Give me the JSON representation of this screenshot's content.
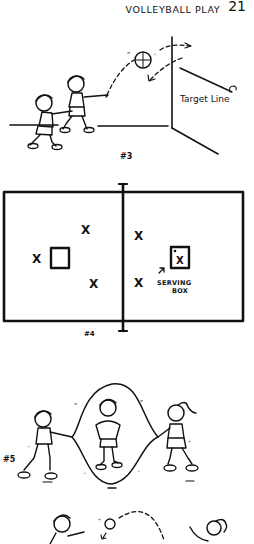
{
  "header": {
    "title": "VOLLEYBALL PLAY",
    "page_number": "21"
  },
  "figures": [
    {
      "number": "#3",
      "description": "Two children, one tossing a ball against a wall above a target line",
      "labels": {
        "target_line": "Target Line"
      }
    },
    {
      "number": "#4",
      "description": "Court diagram divided by a net, with player positions marked X and a serving box",
      "labels": {
        "serving_box": "SERVING BOX",
        "serving_box_line1": "SERVING",
        "serving_box_line2": "BOX"
      },
      "markers": {
        "left_court": [
          "X",
          "X",
          "X"
        ],
        "right_court": [
          "X",
          "X",
          "X"
        ]
      }
    },
    {
      "number": "#5",
      "description": "Two children turning a jump rope while a third child jumps in the middle"
    },
    {
      "number": "",
      "description": "Two children tossing a ball to each other (partially visible)"
    }
  ],
  "colors": {
    "ink": "#111111",
    "paper": "#ffffff"
  }
}
